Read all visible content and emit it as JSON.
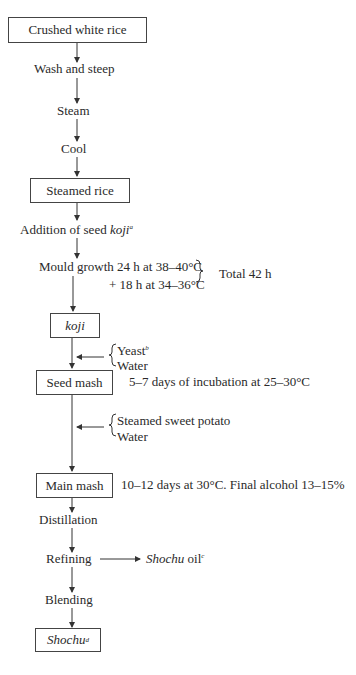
{
  "flow": {
    "box_crushed_rice": "Crushed white rice",
    "wash_steep": "Wash and steep",
    "steam": "Steam",
    "cool": "Cool",
    "box_steamed_rice": "Steamed rice",
    "addition_seed": "Addition of seed ",
    "addition_seed_koji": "koji",
    "addition_seed_note": "a",
    "mould_line1": "Mould growth 24 h at 38–40°C",
    "mould_line2": "+ 18 h at 34–36°C",
    "mould_total": "Total 42 h",
    "box_koji": "koji",
    "input1_yeast": "Yeast",
    "input1_yeast_note": "b",
    "input1_water": "Water",
    "box_seed_mash": "Seed mash",
    "seed_mash_note": "5–7 days of incubation at 25–30°C",
    "input2_potato": "Steamed sweet potato",
    "input2_water": "Water",
    "box_main_mash": "Main mash",
    "main_mash_note": "10–12 days at 30°C. Final alcohol 13–15%",
    "distillation": "Distillation",
    "refining": "Refining",
    "byproduct": "Shochu",
    "byproduct_suffix": " oil",
    "byproduct_note": "c",
    "blending": "Blending",
    "box_shochu": "Shochu",
    "box_shochu_note": "d"
  }
}
